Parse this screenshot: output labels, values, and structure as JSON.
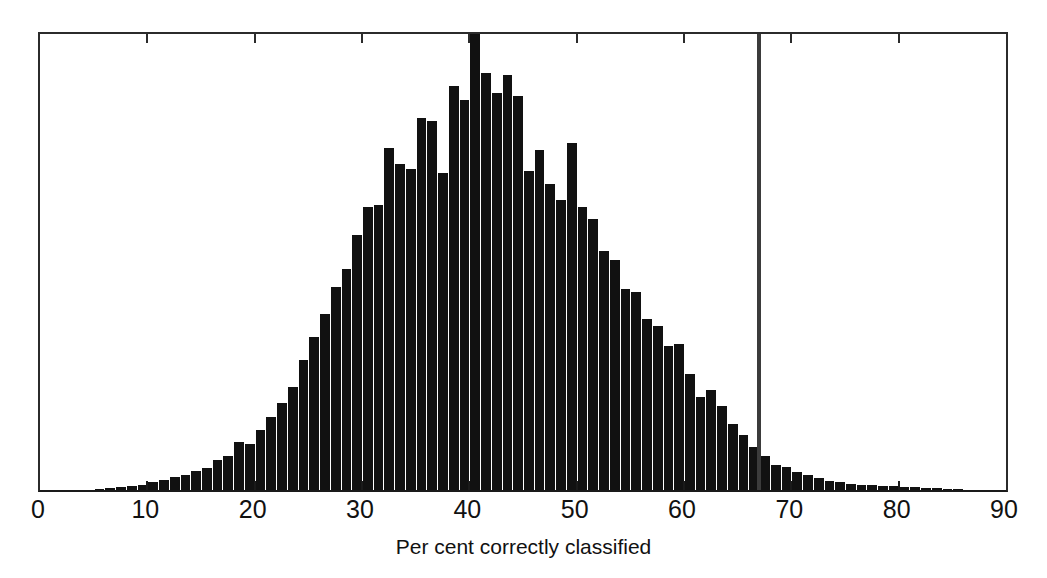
{
  "chart_data": {
    "type": "bar",
    "title": "",
    "subtitle": "",
    "xlabel": "Per cent correctly classified",
    "ylabel": "",
    "xlim": [
      0,
      90
    ],
    "ylim": [
      0,
      100
    ],
    "grid": false,
    "legend": null,
    "bin_width": 1,
    "xticks": [
      0,
      10,
      20,
      30,
      40,
      50,
      60,
      70,
      80,
      90
    ],
    "xtick_labels": [
      "0",
      "10",
      "20",
      "30",
      "40",
      "50",
      "60",
      "70",
      "80",
      "90"
    ],
    "yticks": [],
    "ytick_labels": [],
    "bar_color": "#111111",
    "frame_color": "#2b2b2b",
    "annotations": [
      {
        "type": "vertical-reference-line",
        "x": 67,
        "color": "#3b3b3b",
        "label": ""
      }
    ],
    "categories": [
      5,
      6,
      7,
      8,
      9,
      10,
      11,
      12,
      13,
      14,
      15,
      16,
      17,
      18,
      19,
      20,
      21,
      22,
      23,
      24,
      25,
      26,
      27,
      28,
      29,
      30,
      31,
      32,
      33,
      34,
      35,
      36,
      37,
      38,
      39,
      40,
      41,
      42,
      43,
      44,
      45,
      46,
      47,
      48,
      49,
      50,
      51,
      52,
      53,
      54,
      55,
      56,
      57,
      58,
      59,
      60,
      61,
      62,
      63,
      64,
      65,
      66,
      67,
      68,
      69,
      70,
      71,
      72,
      73,
      74,
      75,
      76,
      77,
      78,
      79,
      80,
      81,
      82,
      83,
      84,
      85
    ],
    "values": [
      0.3,
      0.4,
      0.6,
      0.9,
      1.2,
      1.8,
      2.2,
      2.8,
      3.2,
      4.2,
      4.8,
      6.5,
      7.5,
      10.5,
      10.0,
      13.2,
      16.0,
      19.0,
      22.5,
      28.5,
      33.5,
      38.5,
      44.5,
      48.5,
      56.0,
      62.0,
      62.5,
      75.0,
      71.5,
      70.5,
      81.5,
      81.0,
      69.5,
      88.5,
      85.5,
      100.0,
      91.5,
      87.0,
      91.0,
      86.5,
      70.0,
      74.5,
      67.0,
      63.5,
      76.0,
      62.0,
      59.5,
      52.5,
      50.5,
      44.0,
      43.5,
      37.5,
      36.0,
      31.5,
      32.0,
      25.5,
      20.5,
      22.0,
      18.5,
      14.5,
      12.0,
      9.5,
      7.5,
      5.5,
      5.0,
      4.0,
      3.2,
      2.6,
      2.0,
      1.7,
      1.4,
      1.2,
      1.0,
      0.9,
      0.8,
      0.7,
      0.6,
      0.5,
      0.4,
      0.3,
      0.2
    ]
  },
  "axis": {
    "xlabel": "Per cent correctly classified"
  }
}
